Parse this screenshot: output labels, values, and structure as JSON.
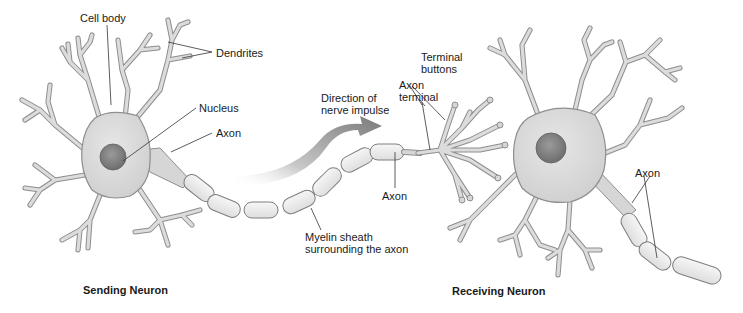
{
  "diagram": {
    "type": "anatomical-illustration",
    "colors": {
      "background": "#ffffff",
      "cell_fill": "#dcdcdc",
      "cell_outline": "#8e8e8e",
      "nucleus": "#7d7d7d",
      "myelin": "#ececec",
      "arrow": "#8a8a8a",
      "label_text": "#1a1a1a"
    },
    "labels": {
      "cell_body": "Cell body",
      "dendrites": "Dendrites",
      "nucleus": "Nucleus",
      "axon_sending": "Axon",
      "direction_line1": "Direction of",
      "direction_line2": "nerve impulse",
      "terminal_buttons_line1": "Terminal",
      "terminal_buttons_line2": "buttons",
      "axon_terminal_line1": "Axon",
      "axon_terminal_line2": "terminal",
      "axon_middle": "Axon",
      "myelin_line1": "Myelin sheath",
      "myelin_line2": "surrounding the axon",
      "axon_receiving": "Axon"
    },
    "titles": {
      "sending": "Sending Neuron",
      "receiving": "Receiving Neuron"
    },
    "nodes": [
      {
        "id": "sending-neuron",
        "parts": [
          "dendrites",
          "cell body",
          "nucleus",
          "axon",
          "myelin sheath",
          "axon terminal",
          "terminal buttons"
        ]
      },
      {
        "id": "receiving-neuron",
        "parts": [
          "dendrites",
          "cell body",
          "nucleus",
          "axon",
          "myelin sheath"
        ]
      }
    ],
    "edges": [
      {
        "from": "sending-neuron",
        "to": "receiving-neuron",
        "label": "Direction of nerve impulse"
      }
    ]
  }
}
